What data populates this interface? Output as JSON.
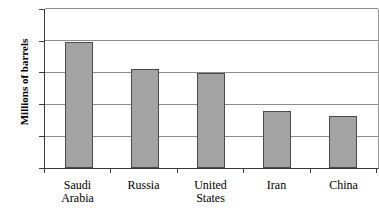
{
  "chart_data": {
    "type": "bar",
    "title": "",
    "subtitle": "",
    "xlabel": "",
    "ylabel": "Millions of barrels",
    "ylim": [
      0,
      10
    ],
    "ytick_labels": [
      "10",
      "8",
      "6",
      "4",
      "2",
      "0"
    ],
    "ytick_values": [
      10,
      8,
      6,
      4,
      2,
      0
    ],
    "grid": true,
    "legend": false,
    "categories": [
      "Saudi Arabia",
      "Russia",
      "United States",
      "Iran",
      "China"
    ],
    "category_lines": [
      [
        "Saudi",
        "Arabia"
      ],
      [
        "Russia",
        ""
      ],
      [
        "United",
        "States"
      ],
      [
        "Iran",
        ""
      ],
      [
        "China",
        ""
      ]
    ],
    "values": [
      7.9,
      6.2,
      6.0,
      3.6,
      3.3
    ],
    "series": [
      {
        "name": "Oil production",
        "values": [
          7.9,
          6.2,
          6.0,
          3.6,
          3.3
        ]
      }
    ],
    "colors": {
      "bar_fill": "#a3a3a3",
      "bar_border": "#4a4a4a",
      "gridline": "#8c8c8c",
      "axis": "#3a3a3a",
      "background": "#ffffff",
      "text": "#000000"
    }
  }
}
